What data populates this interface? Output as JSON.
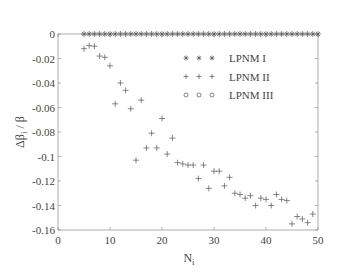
{
  "chart_data": {
    "type": "scatter",
    "title": "",
    "xlabel": "N",
    "xlabel_sub": "i",
    "ylabel": "Δβ",
    "ylabel_sub": "i",
    "ylabel_suffix": " / β",
    "xlim": [
      0,
      50
    ],
    "ylim": [
      -0.16,
      0
    ],
    "xticks": [
      0,
      10,
      20,
      30,
      40,
      50
    ],
    "xtick_labels": [
      "0",
      "10",
      "20",
      "30",
      "40",
      "50"
    ],
    "yticks": [
      0,
      -0.02,
      -0.04,
      -0.06,
      -0.08,
      -0.1,
      -0.12,
      -0.14,
      -0.16
    ],
    "ytick_labels": [
      "0",
      "-0.02",
      "-0.04",
      "-0.06",
      "-0.08",
      "-0.1",
      "-0.12",
      "-0.14",
      "-0.16"
    ],
    "grid": false,
    "legend_position": "upper right (inside)",
    "series": [
      {
        "name": "LPNM I",
        "marker": "asterisk",
        "x": [
          5,
          6,
          7,
          8,
          9,
          10,
          11,
          12,
          13,
          14,
          15,
          16,
          17,
          18,
          19,
          20,
          21,
          22,
          23,
          24,
          25,
          26,
          27,
          28,
          29,
          30,
          31,
          32,
          33,
          34,
          35,
          36,
          37,
          38,
          39,
          40,
          41,
          42,
          43,
          44,
          45,
          46,
          47,
          48,
          49,
          50
        ],
        "y": [
          0,
          0,
          0,
          0,
          0,
          0,
          0,
          0,
          0,
          0,
          0,
          0,
          0,
          0,
          0,
          0,
          0,
          0,
          0,
          0,
          0,
          0,
          0,
          0,
          0,
          0,
          0,
          0,
          0,
          0,
          0,
          0,
          0,
          0,
          0,
          0,
          0,
          0,
          0,
          0,
          0,
          0,
          0,
          0,
          0,
          0
        ]
      },
      {
        "name": "LPNM II",
        "marker": "plus",
        "x": [
          5,
          6,
          7,
          8,
          9,
          10,
          11,
          12,
          13,
          14,
          15,
          16,
          17,
          18,
          19,
          20,
          21,
          22,
          23,
          24,
          25,
          26,
          27,
          28,
          29,
          30,
          31,
          32,
          33,
          34,
          35,
          36,
          37,
          38,
          39,
          40,
          41,
          42,
          43,
          44,
          45,
          46,
          47,
          48,
          49
        ],
        "y": [
          -0.012,
          -0.0095,
          -0.01,
          -0.018,
          -0.019,
          -0.026,
          -0.057,
          -0.04,
          -0.046,
          -0.061,
          -0.103,
          -0.054,
          -0.093,
          -0.081,
          -0.093,
          -0.069,
          -0.098,
          -0.085,
          -0.105,
          -0.106,
          -0.107,
          -0.107,
          -0.118,
          -0.107,
          -0.126,
          -0.112,
          -0.112,
          -0.124,
          -0.117,
          -0.13,
          -0.131,
          -0.134,
          -0.132,
          -0.14,
          -0.134,
          -0.135,
          -0.14,
          -0.131,
          -0.135,
          -0.136,
          -0.155,
          -0.149,
          -0.151,
          -0.154,
          -0.147
        ]
      },
      {
        "name": "LPNM III",
        "marker": "circle",
        "x": [],
        "y": []
      }
    ]
  },
  "legend": {
    "items": [
      {
        "label": "LPNM I",
        "marker": "asterisk"
      },
      {
        "label": "LPNM II",
        "marker": "plus"
      },
      {
        "label": "LPNM III",
        "marker": "circle"
      }
    ]
  },
  "colors": {
    "axis": "#9a9a9a",
    "marker": "#555555",
    "text": "#444444"
  }
}
